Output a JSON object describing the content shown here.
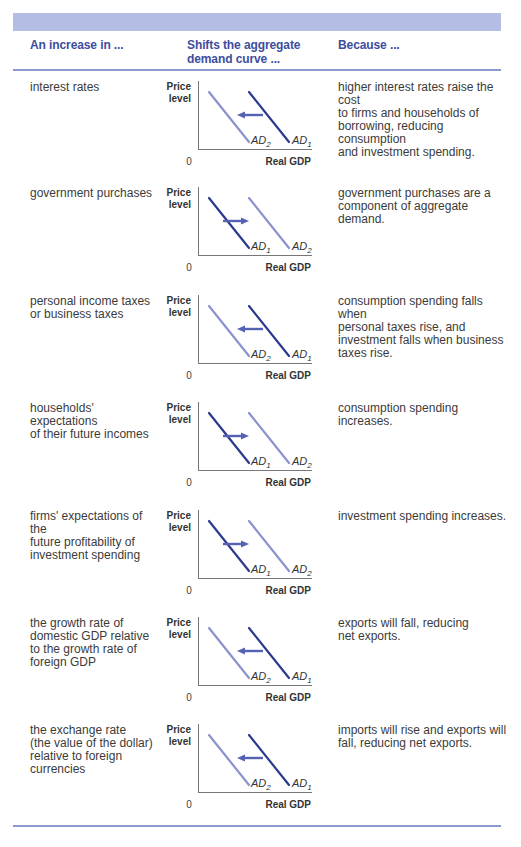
{
  "header": {
    "col1": "An increase in ...",
    "col2_line1": "Shifts the aggregate",
    "col2_line2": "demand curve ...",
    "col3": "Because ..."
  },
  "colors": {
    "band": "#b4bde4",
    "header_text": "#3d4d9e",
    "rule": "#8e97cf",
    "ad_dark": "#2c3a8e",
    "ad_light": "#8b93cf",
    "arrow": "#5562b3"
  },
  "axis": {
    "y_label_line1": "Price",
    "y_label_line2": "level",
    "x_label": "Real GDP",
    "origin": "0"
  },
  "rows": [
    {
      "cause": [
        "interest rates"
      ],
      "shift": "left",
      "reason": [
        "higher interest rates raise the cost",
        "to firms and households of",
        "borrowing, reducing consumption",
        "and investment spending."
      ]
    },
    {
      "cause": [
        "government purchases"
      ],
      "shift": "right",
      "reason": [
        "government purchases are a",
        "component of aggregate demand."
      ]
    },
    {
      "cause": [
        "personal income taxes",
        "or business taxes"
      ],
      "shift": "left",
      "reason": [
        "consumption spending falls when",
        "personal taxes rise, and",
        "investment falls when business",
        "taxes rise."
      ]
    },
    {
      "cause": [
        "households' expectations",
        "of their future incomes"
      ],
      "shift": "right",
      "reason": [
        "consumption spending increases."
      ]
    },
    {
      "cause": [
        "firms' expectations of the",
        "future profitability of",
        "investment spending"
      ],
      "shift": "right",
      "reason": [
        "investment spending increases."
      ]
    },
    {
      "cause": [
        "the growth rate of",
        "domestic GDP relative",
        "to the growth rate of",
        "foreign GDP"
      ],
      "shift": "left",
      "reason": [
        "exports will fall, reducing",
        "net exports."
      ]
    },
    {
      "cause": [
        "the exchange rate",
        "(the value of the dollar)",
        "relative to foreign",
        "currencies"
      ],
      "shift": "left",
      "reason": [
        "imports will rise and exports will",
        "fall, reducing net exports."
      ]
    }
  ],
  "chart_data": [
    {
      "type": "line",
      "title": "interest rates",
      "xlabel": "Real GDP",
      "ylabel": "Price level",
      "series": [
        {
          "name": "AD1",
          "position": "right"
        },
        {
          "name": "AD2",
          "position": "left"
        }
      ],
      "shift": "left"
    },
    {
      "type": "line",
      "title": "government purchases",
      "xlabel": "Real GDP",
      "ylabel": "Price level",
      "series": [
        {
          "name": "AD1",
          "position": "left"
        },
        {
          "name": "AD2",
          "position": "right"
        }
      ],
      "shift": "right"
    },
    {
      "type": "line",
      "title": "personal income taxes or business taxes",
      "xlabel": "Real GDP",
      "ylabel": "Price level",
      "series": [
        {
          "name": "AD1",
          "position": "right"
        },
        {
          "name": "AD2",
          "position": "left"
        }
      ],
      "shift": "left"
    },
    {
      "type": "line",
      "title": "households' expectations of their future incomes",
      "xlabel": "Real GDP",
      "ylabel": "Price level",
      "series": [
        {
          "name": "AD1",
          "position": "left"
        },
        {
          "name": "AD2",
          "position": "right"
        }
      ],
      "shift": "right"
    },
    {
      "type": "line",
      "title": "firms' expectations of the future profitability of investment spending",
      "xlabel": "Real GDP",
      "ylabel": "Price level",
      "series": [
        {
          "name": "AD1",
          "position": "left"
        },
        {
          "name": "AD2",
          "position": "right"
        }
      ],
      "shift": "right"
    },
    {
      "type": "line",
      "title": "the growth rate of domestic GDP relative to the growth rate of foreign GDP",
      "xlabel": "Real GDP",
      "ylabel": "Price level",
      "series": [
        {
          "name": "AD1",
          "position": "right"
        },
        {
          "name": "AD2",
          "position": "left"
        }
      ],
      "shift": "left"
    },
    {
      "type": "line",
      "title": "the exchange rate relative to foreign currencies",
      "xlabel": "Real GDP",
      "ylabel": "Price level",
      "series": [
        {
          "name": "AD1",
          "position": "right"
        },
        {
          "name": "AD2",
          "position": "left"
        }
      ],
      "shift": "left"
    }
  ]
}
